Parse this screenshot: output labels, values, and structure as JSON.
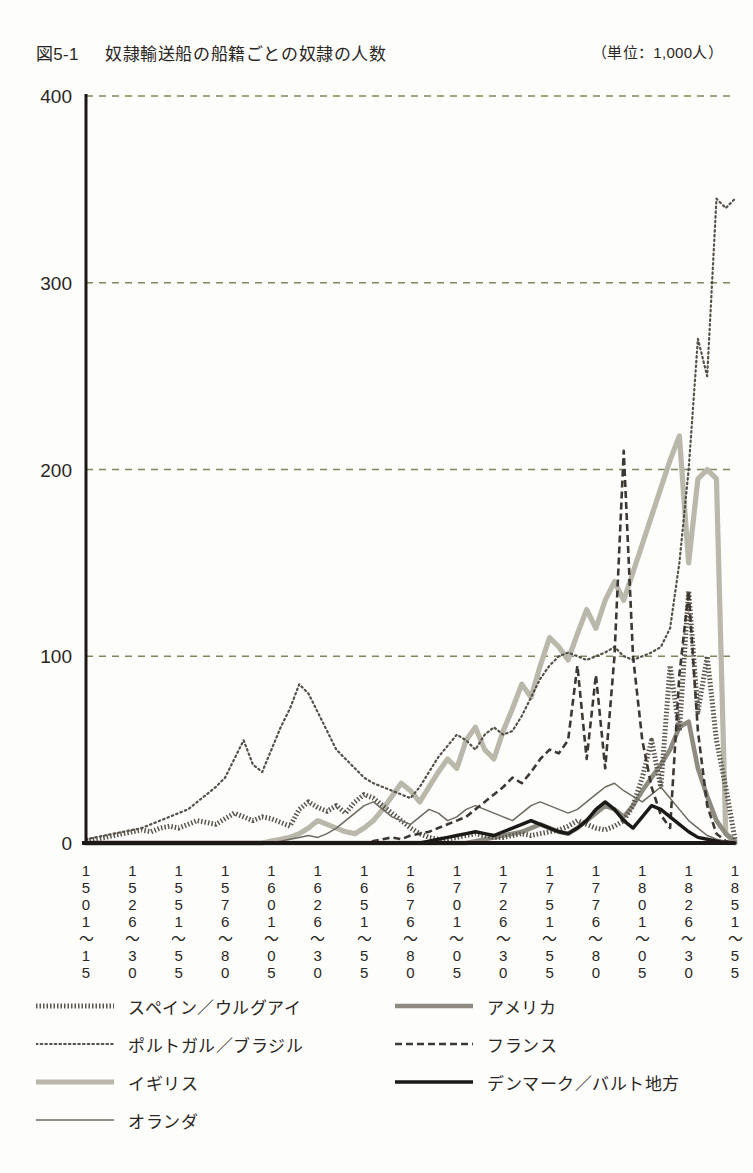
{
  "header": {
    "figure_number": "図5-1",
    "title": "奴隷輸送船の船籍ごとの奴隷の人数",
    "unit_note": "（単位：1,000人）"
  },
  "colors": {
    "text": "#2a2623",
    "grid": "#7d8a5e",
    "axis": "#1b1815",
    "spain": "#5a564e",
    "portugal": "#55514a",
    "britain": "#b9b8aa",
    "netherlands": "#6e6a61",
    "america": "#8e8b80",
    "france": "#3c3833",
    "denmark": "#1c1a17"
  },
  "legend": {
    "items": [
      {
        "label": "スペイン／ウルグアイ",
        "style": "dotted-thick",
        "color": "#5a564e",
        "column": "left",
        "row": 0
      },
      {
        "label": "アメリカ",
        "style": "solid-thick",
        "color": "#8e8b80",
        "column": "right",
        "row": 0
      },
      {
        "label": "ポルトガル／ブラジル",
        "style": "fine-dotted",
        "color": "#55514a",
        "column": "left",
        "row": 1
      },
      {
        "label": "フランス",
        "style": "dashed",
        "color": "#3c3833",
        "column": "right",
        "row": 1
      },
      {
        "label": "イギリス",
        "style": "solid-thick-light",
        "color": "#b9b8aa",
        "column": "left",
        "row": 2
      },
      {
        "label": "デンマーク／バルト地方",
        "style": "solid-thick-black",
        "color": "#1c1a17",
        "column": "right",
        "row": 2
      },
      {
        "label": "オランダ",
        "style": "solid-thin",
        "color": "#6e6a61",
        "column": "left",
        "row": 3
      }
    ]
  },
  "chart_data": {
    "type": "line",
    "title": "奴隷輸送船の船籍ごとの奴隷の人数",
    "xlabel": "",
    "ylabel": "",
    "unit": "1,000人",
    "ylim": [
      0,
      400
    ],
    "yticks": [
      0,
      100,
      200,
      300,
      400
    ],
    "ytick_labels": [
      "0",
      "100",
      "200",
      "300",
      "400"
    ],
    "grid": true,
    "grid_axis": "y",
    "legend_position": "below",
    "xtick_labels": [
      "1501〜15",
      "1526〜30",
      "1551〜55",
      "1576〜80",
      "1601〜05",
      "1626〜30",
      "1651〜55",
      "1676〜80",
      "1701〜05",
      "1726〜30",
      "1751〜55",
      "1776〜80",
      "1801〜05",
      "1826〜30",
      "1851〜55"
    ],
    "xtick_label_rows": [
      [
        "1",
        "5",
        "0",
        "1",
        "〜",
        "1",
        "5"
      ],
      [
        "1",
        "5",
        "2",
        "6",
        "〜",
        "3",
        "0"
      ],
      [
        "1",
        "5",
        "5",
        "1",
        "〜",
        "5",
        "5"
      ],
      [
        "1",
        "5",
        "7",
        "6",
        "〜",
        "8",
        "0"
      ],
      [
        "1",
        "6",
        "0",
        "1",
        "〜",
        "0",
        "5"
      ],
      [
        "1",
        "6",
        "2",
        "6",
        "〜",
        "3",
        "0"
      ],
      [
        "1",
        "6",
        "5",
        "1",
        "〜",
        "5",
        "5"
      ],
      [
        "1",
        "6",
        "7",
        "6",
        "〜",
        "8",
        "0"
      ],
      [
        "1",
        "7",
        "0",
        "1",
        "〜",
        "0",
        "5"
      ],
      [
        "1",
        "7",
        "2",
        "6",
        "〜",
        "3",
        "0"
      ],
      [
        "1",
        "7",
        "5",
        "1",
        "〜",
        "5",
        "5"
      ],
      [
        "1",
        "7",
        "7",
        "6",
        "〜",
        "8",
        "0"
      ],
      [
        "1",
        "8",
        "0",
        "1",
        "〜",
        "0",
        "5"
      ],
      [
        "1",
        "8",
        "2",
        "6",
        "〜",
        "3",
        "0"
      ],
      [
        "1",
        "8",
        "5",
        "1",
        "〜",
        "5",
        "5"
      ]
    ],
    "x_index_count": 71,
    "series": [
      {
        "name": "スペイン／ウルグアイ",
        "style": "dotted-thick",
        "color": "#5a564e",
        "values": [
          1,
          2,
          3,
          4,
          5,
          6,
          7,
          6,
          8,
          9,
          8,
          10,
          12,
          11,
          10,
          13,
          16,
          14,
          12,
          14,
          13,
          11,
          9,
          18,
          22,
          19,
          17,
          20,
          16,
          22,
          26,
          24,
          20,
          16,
          12,
          8,
          5,
          3,
          2,
          2,
          3,
          4,
          5,
          4,
          3,
          3,
          4,
          5,
          4,
          5,
          6,
          7,
          9,
          12,
          10,
          8,
          7,
          9,
          12,
          20,
          35,
          55,
          30,
          95,
          60,
          135,
          70,
          100,
          55,
          30,
          2
        ]
      },
      {
        "name": "ポルトガル／ブラジル",
        "style": "fine-dotted",
        "color": "#55514a",
        "values": [
          2,
          3,
          4,
          5,
          6,
          7,
          8,
          10,
          12,
          14,
          16,
          18,
          22,
          26,
          30,
          35,
          45,
          55,
          42,
          38,
          50,
          62,
          72,
          85,
          80,
          70,
          60,
          50,
          45,
          40,
          35,
          32,
          30,
          28,
          26,
          24,
          30,
          38,
          46,
          52,
          58,
          55,
          50,
          58,
          62,
          58,
          60,
          68,
          78,
          88,
          95,
          100,
          102,
          100,
          98,
          100,
          102,
          105,
          100,
          98,
          100,
          102,
          105,
          115,
          150,
          200,
          270,
          250,
          345,
          340,
          345
        ]
      },
      {
        "name": "イギリス",
        "style": "solid-thick-light",
        "color": "#b9b8aa",
        "values": [
          0,
          0,
          0,
          0,
          0,
          0,
          0,
          0,
          0,
          0,
          0,
          0,
          0,
          0,
          0,
          0,
          0,
          0,
          0,
          0,
          1,
          2,
          3,
          5,
          8,
          12,
          10,
          8,
          6,
          5,
          8,
          12,
          18,
          25,
          32,
          28,
          22,
          30,
          38,
          45,
          40,
          55,
          62,
          50,
          45,
          60,
          72,
          85,
          78,
          95,
          110,
          105,
          98,
          112,
          125,
          115,
          130,
          140,
          130,
          145,
          160,
          175,
          190,
          205,
          218,
          150,
          195,
          200,
          195,
          5,
          0
        ]
      },
      {
        "name": "オランダ",
        "style": "solid-thin",
        "color": "#6e6a61",
        "values": [
          0,
          0,
          0,
          0,
          0,
          0,
          0,
          0,
          0,
          0,
          0,
          0,
          0,
          0,
          0,
          0,
          0,
          0,
          0,
          0,
          0,
          1,
          2,
          3,
          4,
          3,
          5,
          8,
          12,
          16,
          20,
          22,
          18,
          14,
          12,
          10,
          14,
          18,
          16,
          12,
          14,
          18,
          20,
          18,
          16,
          14,
          12,
          16,
          20,
          22,
          20,
          18,
          16,
          18,
          22,
          26,
          30,
          32,
          28,
          25,
          22,
          26,
          30,
          24,
          18,
          12,
          8,
          4,
          2,
          1,
          0
        ]
      },
      {
        "name": "アメリカ",
        "style": "solid-thick",
        "color": "#8e8b80",
        "values": [
          0,
          0,
          0,
          0,
          0,
          0,
          0,
          0,
          0,
          0,
          0,
          0,
          0,
          0,
          0,
          0,
          0,
          0,
          0,
          0,
          0,
          0,
          0,
          0,
          0,
          0,
          0,
          0,
          0,
          0,
          0,
          0,
          0,
          0,
          0,
          0,
          0,
          0,
          0,
          0,
          0,
          0,
          1,
          2,
          3,
          4,
          5,
          6,
          8,
          10,
          8,
          6,
          5,
          8,
          12,
          16,
          20,
          18,
          14,
          20,
          28,
          35,
          42,
          50,
          62,
          65,
          40,
          25,
          12,
          5,
          1
        ]
      },
      {
        "name": "フランス",
        "style": "dashed",
        "color": "#3c3833",
        "values": [
          0,
          0,
          0,
          0,
          0,
          0,
          0,
          0,
          0,
          0,
          0,
          0,
          0,
          0,
          0,
          0,
          0,
          0,
          0,
          0,
          0,
          0,
          0,
          0,
          0,
          0,
          0,
          0,
          0,
          0,
          0,
          1,
          2,
          3,
          2,
          4,
          5,
          6,
          8,
          10,
          12,
          14,
          18,
          22,
          26,
          30,
          35,
          32,
          38,
          45,
          50,
          48,
          55,
          95,
          45,
          90,
          40,
          100,
          210,
          100,
          55,
          30,
          15,
          8,
          90,
          135,
          60,
          20,
          5,
          1,
          0
        ]
      },
      {
        "name": "デンマーク／バルト地方",
        "style": "solid-thick-black",
        "color": "#1c1a17",
        "values": [
          0,
          0,
          0,
          0,
          0,
          0,
          0,
          0,
          0,
          0,
          0,
          0,
          0,
          0,
          0,
          0,
          0,
          0,
          0,
          0,
          0,
          0,
          0,
          0,
          0,
          0,
          0,
          0,
          0,
          0,
          0,
          0,
          0,
          0,
          0,
          0,
          0,
          1,
          2,
          3,
          4,
          5,
          6,
          5,
          4,
          6,
          8,
          10,
          12,
          10,
          8,
          6,
          5,
          8,
          12,
          18,
          22,
          18,
          12,
          8,
          14,
          20,
          18,
          14,
          10,
          6,
          3,
          2,
          1,
          0,
          0
        ]
      }
    ]
  }
}
